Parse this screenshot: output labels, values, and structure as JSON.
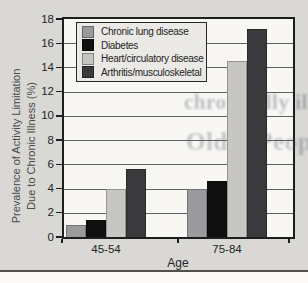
{
  "palette": {
    "page_bg": "#d9d8d4",
    "plot_bg": "#f8f7f3",
    "frame": "#1e1e1e",
    "grid": "#5f5e60",
    "text": "#242424",
    "subtext": "#4a4a4a",
    "legend_bg": "#eae9e5",
    "legend_border": "#262626",
    "rule": "#504f4b",
    "strip": "#fbfaf7",
    "ghost": "#4b4d66"
  },
  "ghost_text": {
    "line1": "chronically ill",
    "line2": "Older People"
  },
  "chart_data": {
    "type": "bar",
    "title": "",
    "xlabel": "Age",
    "ylabel": "Prevalence of Activity Limitation Due to Chronic Illness (%)",
    "ylabel_lines": [
      "Prevalence of Activity Limitation",
      "Due to Chronic Illness (%)"
    ],
    "ylim": [
      0,
      18
    ],
    "yticks": [
      0,
      2,
      4,
      6,
      8,
      10,
      12,
      14,
      16,
      18
    ],
    "grid": true,
    "legend_position": "top-left-inside",
    "categories": [
      "45-54",
      "75-84"
    ],
    "series": [
      {
        "name": "Chronic lung disease",
        "color": "#9b9a9c",
        "values": [
          1.0,
          4.0
        ]
      },
      {
        "name": "Diabetes",
        "color": "#101010",
        "values": [
          1.4,
          4.6
        ]
      },
      {
        "name": "Heart/circulatory disease",
        "color": "#c7c6c3",
        "values": [
          4.0,
          14.5
        ]
      },
      {
        "name": "Arthritis/musculoskeletal",
        "color": "#3a393b",
        "values": [
          5.6,
          17.2
        ]
      }
    ]
  }
}
